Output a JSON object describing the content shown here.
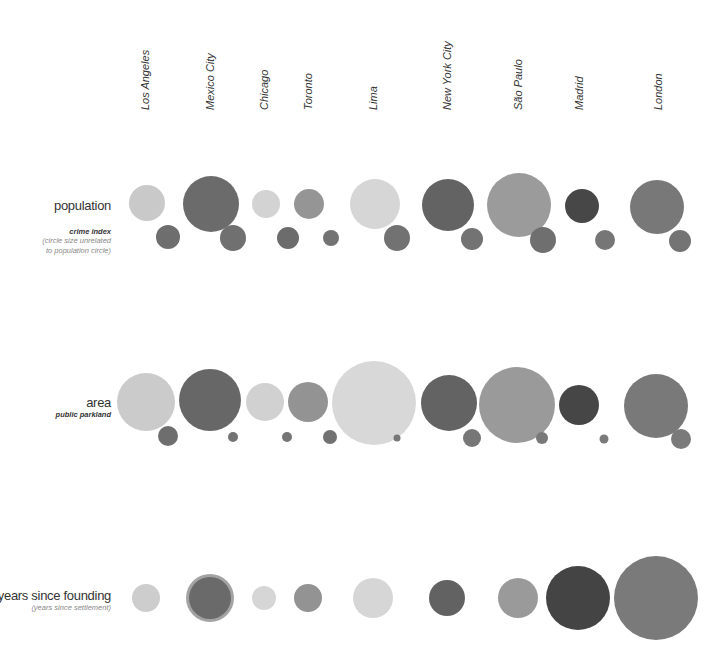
{
  "chart_data": {
    "type": "bubble",
    "title": "",
    "cities": [
      "Los Angeles",
      "Mexico City",
      "Chicago",
      "Toronto",
      "Lima",
      "New York City",
      "São Paulo",
      "Madrid",
      "London"
    ],
    "city_label_x": [
      146,
      211,
      265,
      309,
      374,
      448,
      519,
      580,
      659
    ],
    "rows": [
      {
        "key": "population",
        "label": "population",
        "sub_bold": "crime index",
        "sub_lines": [
          "(circle size unrelated",
          "to population circle)"
        ],
        "label_y": 198,
        "primary": [
          {
            "city": "Los Angeles",
            "cx": 147,
            "cy": 203,
            "r": 18,
            "color": "#c9c9c9"
          },
          {
            "city": "Mexico City",
            "cx": 211,
            "cy": 204,
            "r": 28,
            "color": "#6b6b6b"
          },
          {
            "city": "Chicago",
            "cx": 266,
            "cy": 204,
            "r": 14,
            "color": "#d3d3d3"
          },
          {
            "city": "Toronto",
            "cx": 309,
            "cy": 204,
            "r": 15,
            "color": "#959595"
          },
          {
            "city": "Lima",
            "cx": 375,
            "cy": 204,
            "r": 25,
            "color": "#d6d6d6"
          },
          {
            "city": "New York City",
            "cx": 448,
            "cy": 205,
            "r": 26,
            "color": "#636363"
          },
          {
            "city": "São Paulo",
            "cx": 519,
            "cy": 205,
            "r": 32,
            "color": "#9b9b9b"
          },
          {
            "city": "Madrid",
            "cx": 582,
            "cy": 206,
            "r": 17,
            "color": "#474747"
          },
          {
            "city": "London",
            "cx": 657,
            "cy": 207,
            "r": 27,
            "color": "#787878"
          }
        ],
        "secondary_label": "crime index",
        "secondary": [
          {
            "city": "Los Angeles",
            "cx": 168,
            "cy": 237,
            "r": 12,
            "color": "#6e6e6e"
          },
          {
            "city": "Mexico City",
            "cx": 233,
            "cy": 238,
            "r": 13,
            "color": "#707070"
          },
          {
            "city": "Chicago",
            "cx": 288,
            "cy": 238,
            "r": 11,
            "color": "#6c6c6c"
          },
          {
            "city": "Toronto",
            "cx": 331,
            "cy": 238,
            "r": 8,
            "color": "#737373"
          },
          {
            "city": "Lima",
            "cx": 397,
            "cy": 238,
            "r": 13,
            "color": "#727272"
          },
          {
            "city": "New York City",
            "cx": 472,
            "cy": 239,
            "r": 11,
            "color": "#737373"
          },
          {
            "city": "São Paulo",
            "cx": 543,
            "cy": 240,
            "r": 13,
            "color": "#6f6f6f"
          },
          {
            "city": "Madrid",
            "cx": 605,
            "cy": 240,
            "r": 10,
            "color": "#767676"
          },
          {
            "city": "London",
            "cx": 680,
            "cy": 241,
            "r": 11,
            "color": "#747474"
          }
        ]
      },
      {
        "key": "area",
        "label": "area",
        "sub_bold": "public parkland",
        "sub_lines": [],
        "label_y": 395,
        "primary": [
          {
            "city": "Los Angeles",
            "cx": 146,
            "cy": 402,
            "r": 29,
            "color": "#cbcbcb"
          },
          {
            "city": "Mexico City",
            "cx": 210,
            "cy": 400,
            "r": 31,
            "color": "#676767"
          },
          {
            "city": "Chicago",
            "cx": 265,
            "cy": 402,
            "r": 19,
            "color": "#d1d1d1"
          },
          {
            "city": "Toronto",
            "cx": 308,
            "cy": 402,
            "r": 20,
            "color": "#939393"
          },
          {
            "city": "Lima",
            "cx": 374,
            "cy": 403,
            "r": 42,
            "color": "#d8d8d8"
          },
          {
            "city": "New York City",
            "cx": 449,
            "cy": 403,
            "r": 28,
            "color": "#636363"
          },
          {
            "city": "São Paulo",
            "cx": 517,
            "cy": 405,
            "r": 38,
            "color": "#9a9a9a"
          },
          {
            "city": "Madrid",
            "cx": 579,
            "cy": 405,
            "r": 20,
            "color": "#464646"
          },
          {
            "city": "London",
            "cx": 656,
            "cy": 406,
            "r": 32,
            "color": "#797979"
          }
        ],
        "secondary_label": "public parkland",
        "secondary": [
          {
            "city": "Los Angeles",
            "cx": 168,
            "cy": 436,
            "r": 10,
            "color": "#6e6e6e"
          },
          {
            "city": "Mexico City",
            "cx": 233,
            "cy": 437,
            "r": 5,
            "color": "#737373"
          },
          {
            "city": "Chicago",
            "cx": 287,
            "cy": 437,
            "r": 5,
            "color": "#757575"
          },
          {
            "city": "Toronto",
            "cx": 330,
            "cy": 437,
            "r": 7,
            "color": "#727272"
          },
          {
            "city": "Lima",
            "cx": 397,
            "cy": 438,
            "r": 3.5,
            "color": "#767676"
          },
          {
            "city": "New York City",
            "cx": 472,
            "cy": 438,
            "r": 9,
            "color": "#777777"
          },
          {
            "city": "São Paulo",
            "cx": 542,
            "cy": 438,
            "r": 6,
            "color": "#797979"
          },
          {
            "city": "Madrid",
            "cx": 604,
            "cy": 439,
            "r": 4.5,
            "color": "#7a7a7a"
          },
          {
            "city": "London",
            "cx": 681,
            "cy": 439,
            "r": 10,
            "color": "#7a7a7a"
          }
        ]
      },
      {
        "key": "years",
        "label": "years since founding",
        "sub_bold": "(years since settlement)",
        "sub_lines": [],
        "label_y": 588,
        "primary": [
          {
            "city": "Los Angeles",
            "cx": 146,
            "cy": 598,
            "r": 14,
            "color": "#cdcdcd"
          },
          {
            "city": "Mexico City",
            "cx": 210,
            "cy": 598,
            "r": 21,
            "color": "#6a6a6a",
            "ring_r": 24,
            "ring_color": "#a3a3a3"
          },
          {
            "city": "Chicago",
            "cx": 264,
            "cy": 598,
            "r": 12,
            "color": "#d6d6d6"
          },
          {
            "city": "Toronto",
            "cx": 308,
            "cy": 598,
            "r": 14,
            "color": "#939393"
          },
          {
            "city": "Lima",
            "cx": 373,
            "cy": 598,
            "r": 20,
            "color": "#d6d6d6"
          },
          {
            "city": "New York City",
            "cx": 447,
            "cy": 598,
            "r": 18,
            "color": "#626262"
          },
          {
            "city": "São Paulo",
            "cx": 518,
            "cy": 598,
            "r": 20,
            "color": "#9a9a9a"
          },
          {
            "city": "Madrid",
            "cx": 578,
            "cy": 598,
            "r": 32,
            "color": "#444444"
          },
          {
            "city": "London",
            "cx": 656,
            "cy": 598,
            "r": 42,
            "color": "#7a7a7a"
          }
        ],
        "secondary": []
      }
    ],
    "xlabel": "",
    "ylabel": "",
    "legend": "none",
    "grid": false
  }
}
